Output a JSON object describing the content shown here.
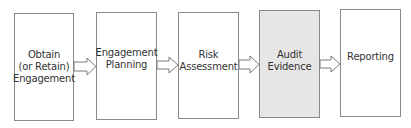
{
  "diagram": {
    "type": "process-flow",
    "direction": "left-to-right",
    "steps": [
      {
        "id": "obtain",
        "lines": [
          "Obtain",
          "(or Retain)",
          "Engagement"
        ],
        "highlighted": false
      },
      {
        "id": "planning",
        "lines": [
          "Engagement",
          "Planning"
        ],
        "highlighted": false
      },
      {
        "id": "risk",
        "lines": [
          "Risk",
          "Assessment"
        ],
        "highlighted": false
      },
      {
        "id": "evidence",
        "lines": [
          "Audit",
          "Evidence"
        ],
        "highlighted": true
      },
      {
        "id": "reporting",
        "lines": [
          "Reporting"
        ],
        "highlighted": false
      }
    ],
    "connectors": [
      {
        "from": "obtain",
        "to": "planning",
        "style": "hollow-block-arrow"
      },
      {
        "from": "planning",
        "to": "risk",
        "style": "hollow-block-arrow"
      },
      {
        "from": "risk",
        "to": "evidence",
        "style": "hollow-block-arrow"
      },
      {
        "from": "evidence",
        "to": "reporting",
        "style": "hollow-block-arrow"
      }
    ],
    "colors": {
      "border": "#8a8a8a",
      "highlight_fill": "#e6e6e6",
      "text": "#333333"
    }
  }
}
